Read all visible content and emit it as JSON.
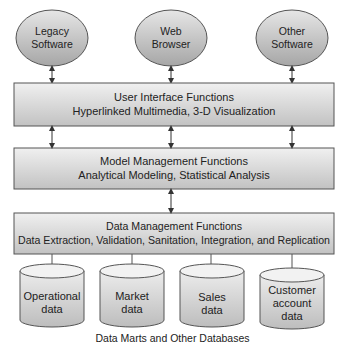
{
  "diagram": {
    "sources": [
      {
        "label_line1": "Legacy",
        "label_line2": "Software"
      },
      {
        "label_line1": "Web",
        "label_line2": "Browser"
      },
      {
        "label_line1": "Other",
        "label_line2": "Software"
      }
    ],
    "layers": [
      {
        "title": "User Interface Functions",
        "subtitle": "Hyperlinked Multimedia, 3-D Visualization"
      },
      {
        "title": "Model Management Functions",
        "subtitle": "Analytical Modeling, Statistical Analysis"
      },
      {
        "title": "Data Management Functions",
        "subtitle": "Data Extraction, Validation, Sanitation, Integration, and Replication"
      }
    ],
    "databases": [
      {
        "lines": [
          "Operational",
          "data"
        ]
      },
      {
        "lines": [
          "Market",
          "data"
        ]
      },
      {
        "lines": [
          "Sales",
          "data"
        ]
      },
      {
        "lines": [
          "Customer",
          "account",
          "data"
        ]
      }
    ],
    "footer_caption": "Data Marts and Other Databases",
    "colors": {
      "ellipse_fill_top": "#e4e4e4",
      "ellipse_fill_bottom": "#a9a9a9",
      "box_fill_top": "#eeeeee",
      "box_fill_bottom": "#c4c4c4",
      "stroke": "#555555"
    }
  }
}
